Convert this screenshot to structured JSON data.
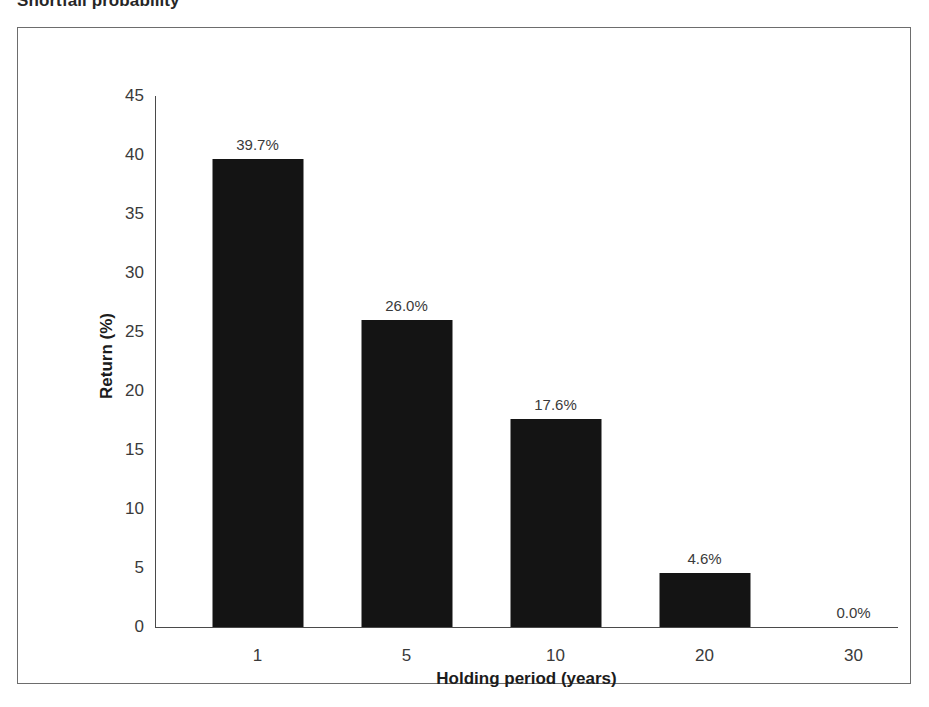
{
  "chart_data": {
    "type": "bar",
    "title": "Shortfall probability",
    "xlabel": "Holding period (years)",
    "ylabel": "Return (%)",
    "categories": [
      "1",
      "5",
      "10",
      "20",
      "30"
    ],
    "values": [
      39.7,
      26.0,
      17.6,
      4.6,
      0.0
    ],
    "data_labels": [
      "39.7%",
      "26.0%",
      "17.6%",
      "4.6%",
      "0.0%"
    ],
    "ylim": [
      0,
      45
    ],
    "ytick_step": 5,
    "yticks": [
      "45",
      "40",
      "35",
      "30",
      "25",
      "20",
      "15",
      "10",
      "5",
      "0"
    ],
    "grid": false,
    "legend": false,
    "bar_color": "#141414",
    "axis_color": "#4a4a4a",
    "frame_color": "#6d6d6d",
    "background": "#ffffff"
  }
}
